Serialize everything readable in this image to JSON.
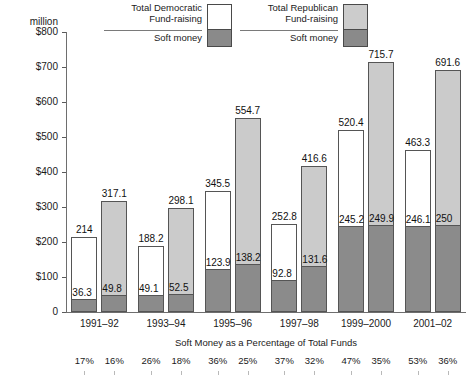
{
  "legend": {
    "groups": [
      {
        "name": "democratic",
        "total_label_line1": "Total Democratic",
        "total_label_line2": "Fund-raising",
        "soft_label": "Soft money",
        "total_color": "#ffffff",
        "soft_color": "#8b8b8b"
      },
      {
        "name": "republican",
        "total_label_line1": "Total Republican",
        "total_label_line2": "Fund-raising",
        "soft_label": "Soft money",
        "total_color": "#cbcbcb",
        "soft_color": "#8b8b8b"
      }
    ]
  },
  "axis": {
    "unit_line1": "$800",
    "unit_line2": "million",
    "ticks": [
      "$800",
      "$700",
      "$600",
      "$500",
      "$400",
      "$300",
      "$200",
      "$100",
      "0"
    ],
    "tick_values": [
      800,
      700,
      600,
      500,
      400,
      300,
      200,
      100,
      0
    ]
  },
  "captions": {
    "percentage_note": "Soft Money as a Percentage of Total Funds"
  },
  "chart_data": {
    "type": "bar",
    "title": "",
    "subtitle": "",
    "xlabel": "",
    "ylabel": "$ million",
    "ylim": [
      0,
      800
    ],
    "ytick_step": 100,
    "grid": false,
    "legend_position": "top-center",
    "categories": [
      "1991–92",
      "1993–94",
      "1995–96",
      "1997–98",
      "1999–2000",
      "2001–02"
    ],
    "series": [
      {
        "name": "Total Democratic Fund-raising",
        "color": "#ffffff",
        "values": [
          214,
          188.2,
          345.5,
          252.8,
          520.4,
          463.3
        ],
        "labels": [
          "214",
          "188.2",
          "345.5",
          "252.8",
          "520.4",
          "463.3"
        ]
      },
      {
        "name": "Democratic Soft money",
        "color": "#8b8b8b",
        "values": [
          36.3,
          49.1,
          123.9,
          92.8,
          245.2,
          246.1
        ],
        "labels": [
          "36.3",
          "49.1",
          "123.9",
          "92.8",
          "245.2",
          "246.1"
        ]
      },
      {
        "name": "Total Republican Fund-raising",
        "color": "#cbcbcb",
        "values": [
          317.1,
          298.1,
          554.7,
          416.6,
          715.7,
          691.6
        ],
        "labels": [
          "317.1",
          "298.1",
          "554.7",
          "416.6",
          "715.7",
          "691.6"
        ]
      },
      {
        "name": "Republican Soft money",
        "color": "#8b8b8b",
        "values": [
          49.8,
          52.5,
          138.2,
          131.6,
          249.9,
          250
        ],
        "labels": [
          "49.8",
          "52.5",
          "138.2",
          "131.6",
          "249.9",
          "250"
        ]
      }
    ],
    "soft_money_percentages": {
      "democratic": [
        "17%",
        "26%",
        "36%",
        "37%",
        "47%",
        "53%"
      ],
      "republican": [
        "16%",
        "18%",
        "25%",
        "32%",
        "35%",
        "36%"
      ]
    }
  }
}
